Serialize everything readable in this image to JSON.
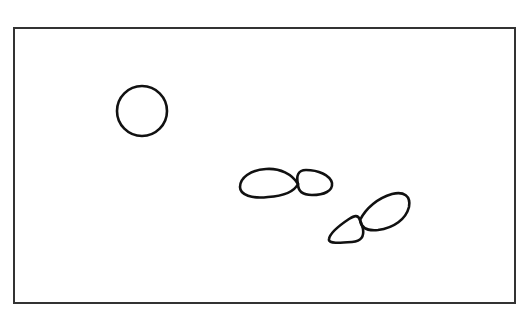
{
  "figure": {
    "stroke_color": "#111111",
    "frame_color": "#333333",
    "background": "#ffffff",
    "shapes": [
      {
        "name": "circle",
        "cx": 142,
        "cy": 111,
        "r": 25
      },
      {
        "name": "footprint-1",
        "parts": [
          "large-oval",
          "small-oval"
        ]
      },
      {
        "name": "footprint-2",
        "parts": [
          "large-oval",
          "triangular-toe"
        ]
      }
    ]
  }
}
